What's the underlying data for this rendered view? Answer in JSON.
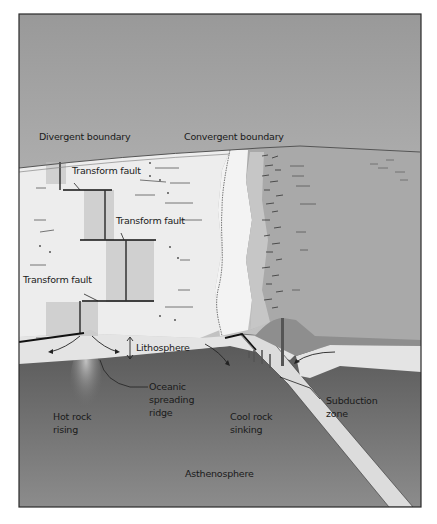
{
  "diagram": {
    "title_labels": {
      "divergent": "Divergent boundary",
      "convergent": "Convergent boundary"
    },
    "labels": {
      "transform_fault_1": "Transform fault",
      "transform_fault_2": "Transform fault",
      "transform_fault_3": "Transform fault",
      "lithosphere": "Lithosphere",
      "oceanic_ridge_line1": "Oceanic",
      "oceanic_ridge_line2": "spreading",
      "oceanic_ridge_line3": "ridge",
      "hot_rock_line1": "Hot rock",
      "hot_rock_line2": "rising",
      "cool_rock_line1": "Cool rock",
      "cool_rock_line2": "sinking",
      "subduction_line1": "Subduction",
      "subduction_line2": "zone",
      "asthenosphere": "Asthenosphere"
    },
    "colors": {
      "sky_top": "#9a9a9a",
      "sky_bottom": "#d6d6d6",
      "ocean_plate": "#ececec",
      "continent": "#a8a8a8",
      "continent_light": "#c4c4c4",
      "lithosphere": "#e2e2e2",
      "asthenosphere_top": "#5e5e5e",
      "asthenosphere_bottom": "#8a8a8a",
      "frame": "#2a2a2a"
    }
  }
}
